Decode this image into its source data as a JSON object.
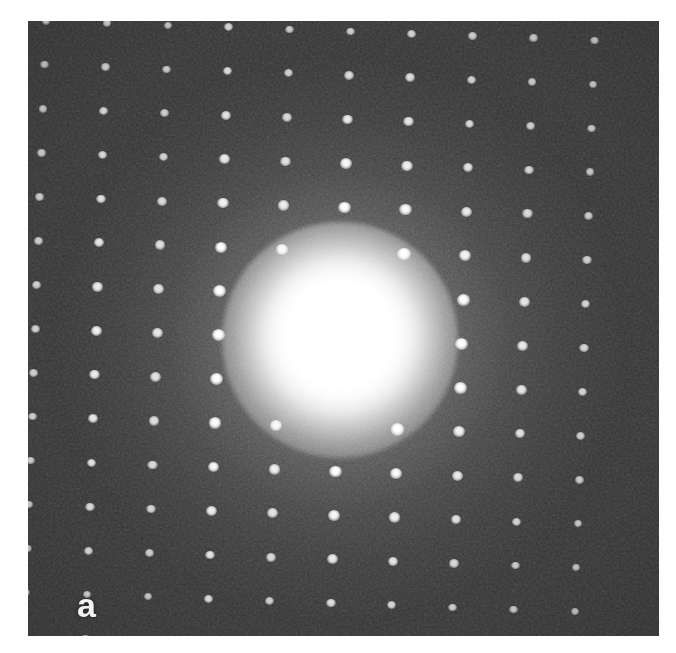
{
  "figure": {
    "kind": "electron-diffraction-pattern",
    "panel_label": "a",
    "caption": "",
    "background_color": "#ffffff",
    "plate_color": "#2e2e2e",
    "spot_color": "#ffffff",
    "plate": {
      "x": 28,
      "y": 21,
      "width": 631,
      "height": 615
    }
  },
  "chart_data": {
    "type": "scatter",
    "title": "",
    "subtitle": "",
    "xlabel": "",
    "ylabel": "",
    "xlim": [
      0,
      631
    ],
    "ylim": [
      0,
      615
    ],
    "grid": false,
    "legend": null,
    "annotations": [
      {
        "text": "a",
        "x": 32,
        "y": 567
      }
    ],
    "lattice": {
      "center": {
        "x": 312,
        "y": 319
      },
      "a_spacing_px": 61.0,
      "b_spacing_px": 44.0,
      "rotation_deg": 2.0,
      "columns": 11,
      "rows": 15
    },
    "direct_beam": {
      "center": {
        "x": 312,
        "y": 319
      },
      "saturated_radius_px": 75,
      "halo_radius_px": 330,
      "label": "000"
    },
    "spots": [
      {
        "h": -5,
        "k": -7,
        "intensity": 0.55
      },
      {
        "h": -4,
        "k": -7,
        "intensity": 0.6
      },
      {
        "h": -3,
        "k": -7,
        "intensity": 0.52
      },
      {
        "h": -2,
        "k": -7,
        "intensity": 0.7
      },
      {
        "h": -1,
        "k": -7,
        "intensity": 0.58
      },
      {
        "h": 0,
        "k": -7,
        "intensity": 0.62
      },
      {
        "h": 1,
        "k": -7,
        "intensity": 0.66
      },
      {
        "h": 2,
        "k": -7,
        "intensity": 0.6
      },
      {
        "h": 3,
        "k": -7,
        "intensity": 0.55
      },
      {
        "h": 4,
        "k": -7,
        "intensity": 0.5
      },
      {
        "h": -5,
        "k": -6,
        "intensity": 0.5
      },
      {
        "h": -4,
        "k": -6,
        "intensity": 0.62
      },
      {
        "h": -3,
        "k": -6,
        "intensity": 0.55
      },
      {
        "h": -2,
        "k": -6,
        "intensity": 0.72
      },
      {
        "h": -1,
        "k": -6,
        "intensity": 0.6
      },
      {
        "h": 0,
        "k": -6,
        "intensity": 0.68
      },
      {
        "h": 1,
        "k": -6,
        "intensity": 0.7
      },
      {
        "h": 2,
        "k": -6,
        "intensity": 0.62
      },
      {
        "h": 3,
        "k": -6,
        "intensity": 0.56
      },
      {
        "h": 4,
        "k": -6,
        "intensity": 0.48
      },
      {
        "h": -5,
        "k": -5,
        "intensity": 0.55
      },
      {
        "h": -4,
        "k": -5,
        "intensity": 0.68
      },
      {
        "h": -3,
        "k": -5,
        "intensity": 0.58
      },
      {
        "h": -2,
        "k": -5,
        "intensity": 0.75
      },
      {
        "h": -1,
        "k": -5,
        "intensity": 0.62
      },
      {
        "h": 0,
        "k": -5,
        "intensity": 0.8
      },
      {
        "h": 1,
        "k": -5,
        "intensity": 0.74
      },
      {
        "h": 2,
        "k": -5,
        "intensity": 0.64
      },
      {
        "h": 3,
        "k": -5,
        "intensity": 0.58
      },
      {
        "h": 4,
        "k": -5,
        "intensity": 0.5
      },
      {
        "h": -5,
        "k": -4,
        "intensity": 0.58
      },
      {
        "h": -4,
        "k": -4,
        "intensity": 0.72
      },
      {
        "h": -3,
        "k": -4,
        "intensity": 0.6
      },
      {
        "h": -2,
        "k": -4,
        "intensity": 0.78
      },
      {
        "h": -1,
        "k": -4,
        "intensity": 0.64
      },
      {
        "h": 0,
        "k": -4,
        "intensity": 0.86
      },
      {
        "h": 1,
        "k": -4,
        "intensity": 0.78
      },
      {
        "h": 2,
        "k": -4,
        "intensity": 0.68
      },
      {
        "h": 3,
        "k": -4,
        "intensity": 0.6
      },
      {
        "h": 4,
        "k": -4,
        "intensity": 0.52
      },
      {
        "h": -5,
        "k": -3,
        "intensity": 0.6
      },
      {
        "h": -4,
        "k": -3,
        "intensity": 0.76
      },
      {
        "h": -3,
        "k": -3,
        "intensity": 0.62
      },
      {
        "h": -2,
        "k": -3,
        "intensity": 0.82
      },
      {
        "h": -1,
        "k": -3,
        "intensity": 0.68
      },
      {
        "h": 0,
        "k": -3,
        "intensity": 0.9
      },
      {
        "h": 1,
        "k": -3,
        "intensity": 0.82
      },
      {
        "h": 2,
        "k": -3,
        "intensity": 0.7
      },
      {
        "h": 3,
        "k": -3,
        "intensity": 0.62
      },
      {
        "h": 4,
        "k": -3,
        "intensity": 0.54
      },
      {
        "h": -5,
        "k": -2,
        "intensity": 0.62
      },
      {
        "h": -4,
        "k": -2,
        "intensity": 0.8
      },
      {
        "h": -3,
        "k": -2,
        "intensity": 0.64
      },
      {
        "h": -2,
        "k": -2,
        "intensity": 0.88
      },
      {
        "h": -1,
        "k": -2,
        "intensity": 0.72
      },
      {
        "h": 1,
        "k": -2,
        "intensity": 0.92
      },
      {
        "h": 2,
        "k": -2,
        "intensity": 0.78
      },
      {
        "h": 3,
        "k": -2,
        "intensity": 0.66
      },
      {
        "h": 4,
        "k": -2,
        "intensity": 0.56
      },
      {
        "h": -5,
        "k": -1,
        "intensity": 0.64
      },
      {
        "h": -4,
        "k": -1,
        "intensity": 0.84
      },
      {
        "h": -3,
        "k": -1,
        "intensity": 0.66
      },
      {
        "h": -2,
        "k": -1,
        "intensity": 0.92
      },
      {
        "h": 2,
        "k": -1,
        "intensity": 0.84
      },
      {
        "h": 3,
        "k": -1,
        "intensity": 0.68
      },
      {
        "h": 4,
        "k": -1,
        "intensity": 0.58
      },
      {
        "h": -5,
        "k": 0,
        "intensity": 0.64
      },
      {
        "h": -4,
        "k": 0,
        "intensity": 0.86
      },
      {
        "h": -3,
        "k": 0,
        "intensity": 0.68
      },
      {
        "h": -2,
        "k": 0,
        "intensity": 0.95
      },
      {
        "h": 2,
        "k": 0,
        "intensity": 0.9
      },
      {
        "h": 3,
        "k": 0,
        "intensity": 0.7
      },
      {
        "h": 4,
        "k": 0,
        "intensity": 0.6
      },
      {
        "h": -5,
        "k": 1,
        "intensity": 0.64
      },
      {
        "h": -4,
        "k": 1,
        "intensity": 0.84
      },
      {
        "h": -3,
        "k": 1,
        "intensity": 0.66
      },
      {
        "h": -2,
        "k": 1,
        "intensity": 0.92
      },
      {
        "h": 2,
        "k": 1,
        "intensity": 0.86
      },
      {
        "h": 3,
        "k": 1,
        "intensity": 0.68
      },
      {
        "h": 4,
        "k": 1,
        "intensity": 0.58
      },
      {
        "h": -5,
        "k": 2,
        "intensity": 0.62
      },
      {
        "h": -4,
        "k": 2,
        "intensity": 0.8
      },
      {
        "h": -3,
        "k": 2,
        "intensity": 0.64
      },
      {
        "h": -2,
        "k": 2,
        "intensity": 0.88
      },
      {
        "h": -1,
        "k": 2,
        "intensity": 0.74
      },
      {
        "h": 1,
        "k": 2,
        "intensity": 0.9
      },
      {
        "h": 2,
        "k": 2,
        "intensity": 0.78
      },
      {
        "h": 3,
        "k": 2,
        "intensity": 0.66
      },
      {
        "h": 4,
        "k": 2,
        "intensity": 0.56
      },
      {
        "h": -5,
        "k": 3,
        "intensity": 0.6
      },
      {
        "h": -4,
        "k": 3,
        "intensity": 0.76
      },
      {
        "h": -3,
        "k": 3,
        "intensity": 0.62
      },
      {
        "h": -2,
        "k": 3,
        "intensity": 0.84
      },
      {
        "h": -1,
        "k": 3,
        "intensity": 0.7
      },
      {
        "h": 0,
        "k": 3,
        "intensity": 0.88
      },
      {
        "h": 1,
        "k": 3,
        "intensity": 0.84
      },
      {
        "h": 2,
        "k": 3,
        "intensity": 0.72
      },
      {
        "h": 3,
        "k": 3,
        "intensity": 0.62
      },
      {
        "h": 4,
        "k": 3,
        "intensity": 0.54
      },
      {
        "h": -5,
        "k": 4,
        "intensity": 0.58
      },
      {
        "h": -4,
        "k": 4,
        "intensity": 0.72
      },
      {
        "h": -3,
        "k": 4,
        "intensity": 0.6
      },
      {
        "h": -2,
        "k": 4,
        "intensity": 0.8
      },
      {
        "h": -1,
        "k": 4,
        "intensity": 0.66
      },
      {
        "h": 0,
        "k": 4,
        "intensity": 0.84
      },
      {
        "h": 1,
        "k": 4,
        "intensity": 0.78
      },
      {
        "h": 2,
        "k": 4,
        "intensity": 0.68
      },
      {
        "h": 3,
        "k": 4,
        "intensity": 0.6
      },
      {
        "h": 4,
        "k": 4,
        "intensity": 0.52
      },
      {
        "h": -5,
        "k": 5,
        "intensity": 0.55
      },
      {
        "h": -4,
        "k": 5,
        "intensity": 0.68
      },
      {
        "h": -3,
        "k": 5,
        "intensity": 0.58
      },
      {
        "h": -2,
        "k": 5,
        "intensity": 0.76
      },
      {
        "h": -1,
        "k": 5,
        "intensity": 0.62
      },
      {
        "h": 0,
        "k": 5,
        "intensity": 0.78
      },
      {
        "h": 1,
        "k": 5,
        "intensity": 0.72
      },
      {
        "h": 2,
        "k": 5,
        "intensity": 0.64
      },
      {
        "h": 3,
        "k": 5,
        "intensity": 0.56
      },
      {
        "h": 4,
        "k": 5,
        "intensity": 0.48
      },
      {
        "h": -5,
        "k": 6,
        "intensity": 0.5
      },
      {
        "h": -4,
        "k": 6,
        "intensity": 0.62
      },
      {
        "h": -3,
        "k": 6,
        "intensity": 0.54
      },
      {
        "h": -2,
        "k": 6,
        "intensity": 0.7
      },
      {
        "h": -1,
        "k": 6,
        "intensity": 0.58
      },
      {
        "h": 0,
        "k": 6,
        "intensity": 0.72
      },
      {
        "h": 1,
        "k": 6,
        "intensity": 0.66
      },
      {
        "h": 2,
        "k": 6,
        "intensity": 0.58
      },
      {
        "h": 3,
        "k": 6,
        "intensity": 0.52
      },
      {
        "h": 4,
        "k": 6,
        "intensity": 0.45
      },
      {
        "h": -4,
        "k": 7,
        "intensity": 0.56
      },
      {
        "h": -3,
        "k": 7,
        "intensity": 0.48
      },
      {
        "h": -2,
        "k": 7,
        "intensity": 0.64
      },
      {
        "h": -1,
        "k": 7,
        "intensity": 0.52
      },
      {
        "h": 0,
        "k": 7,
        "intensity": 0.66
      },
      {
        "h": 1,
        "k": 7,
        "intensity": 0.6
      },
      {
        "h": 2,
        "k": 7,
        "intensity": 0.52
      },
      {
        "h": 3,
        "k": 7,
        "intensity": 0.46
      }
    ]
  }
}
